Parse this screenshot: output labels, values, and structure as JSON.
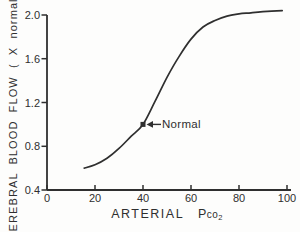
{
  "figure": {
    "background_color": "#fdfdfc",
    "ink_color": "#2f2f2f"
  },
  "chart_data": {
    "type": "line",
    "title": "",
    "xlabel": "ARTERIAL Pco2",
    "ylabel": "CEREBRAL BLOOD FLOW ( X normal)",
    "xlim": [
      0,
      100
    ],
    "ylim": [
      0.4,
      2.0
    ],
    "grid": false,
    "legend": "none",
    "x_ticks": [
      0,
      20,
      40,
      60,
      80,
      100
    ],
    "x_tick_labels": [
      "0",
      "20",
      "40",
      "60",
      "80",
      "100"
    ],
    "y_ticks": [
      0.4,
      0.8,
      1.2,
      1.6,
      2.0
    ],
    "y_tick_labels": [
      "0.4",
      "0.8",
      "1.2",
      "1.6",
      "2.0"
    ],
    "series": [
      {
        "name": "cerebral blood flow vs arterial Pco2",
        "points": [
          [
            15.5,
            0.6
          ],
          [
            20,
            0.63
          ],
          [
            25,
            0.69
          ],
          [
            30,
            0.78
          ],
          [
            35,
            0.89
          ],
          [
            40,
            1.0
          ],
          [
            45,
            1.21
          ],
          [
            50,
            1.43
          ],
          [
            55,
            1.62
          ],
          [
            60,
            1.78
          ],
          [
            65,
            1.89
          ],
          [
            70,
            1.95
          ],
          [
            75,
            1.99
          ],
          [
            80,
            2.01
          ],
          [
            85,
            2.02
          ],
          [
            90,
            2.03
          ],
          [
            98,
            2.04
          ]
        ]
      }
    ],
    "annotation": {
      "label": "Normal",
      "x": 40,
      "y": 1.0
    }
  },
  "labels": {
    "ylabel_text": "CEREBRAL BLOOD FLOW ( X normal)",
    "xlabel_word": "ARTERIAL",
    "xlabel_p": "P",
    "xlabel_co": "co",
    "xlabel_sub": "2",
    "normal_label": "Normal"
  }
}
